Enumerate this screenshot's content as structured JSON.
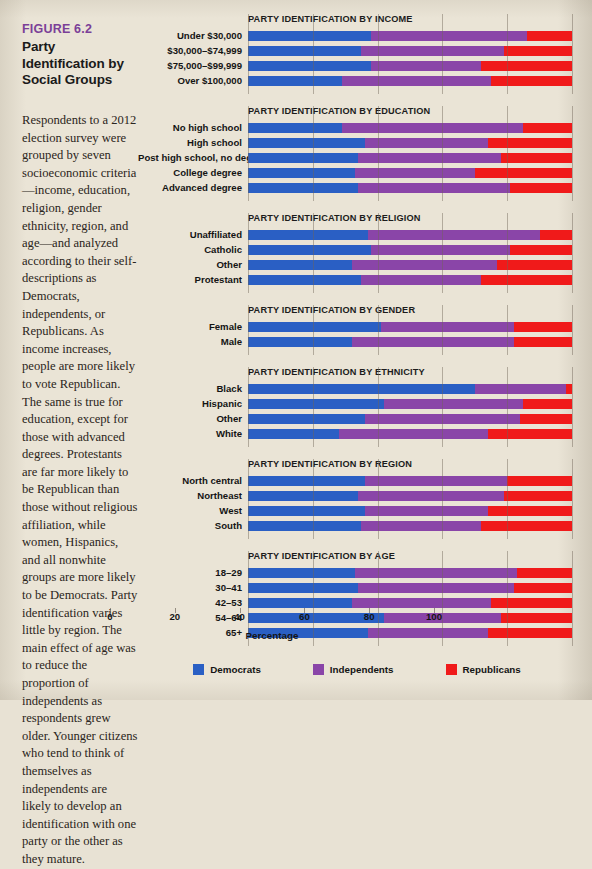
{
  "figure": {
    "label": "FIGURE 6.2",
    "heading": "Party Identification by Social Groups",
    "caption": "Respondents to a 2012 election survey were grouped by seven socioeconomic criteria—income, education, religion, gender ethnicity, region, and age—and analyzed according to their self-descriptions as Democrats, independents, or Republicans. As income increases, people are more likely to vote Republican. The same is true for education, except for those with advanced degrees. Protestants are far more likely to be Republican than those without religious affiliation, while women, Hispanics, and all nonwhite groups are more likely to be Democrats. Party identification varies little by region. The main effect of age was to reduce the proportion of independents as respondents grew older. Younger citizens who tend to think of themselves as independents are likely to develop an identification with one party or the other as they mature."
  },
  "colors": {
    "democrats": "#2a5fc4",
    "independents": "#8a45a8",
    "republicans": "#f01a1a",
    "figure_label": "#7b3f98",
    "background": "#eae4d6"
  },
  "legend": {
    "items": [
      {
        "label": "Democrats",
        "color": "#2a5fc4",
        "key": "dem"
      },
      {
        "label": "Independents",
        "color": "#8a45a8",
        "key": "ind"
      },
      {
        "label": "Republicans",
        "color": "#f01a1a",
        "key": "rep"
      }
    ]
  },
  "axis": {
    "title": "Percentage",
    "ticks": [
      0,
      20,
      40,
      60,
      80,
      100
    ],
    "min": 0,
    "max": 100
  },
  "chart_data": {
    "type": "bar",
    "subtype": "stacked-horizontal",
    "title": "Party Identification by Social Groups",
    "xlabel": "Percentage",
    "ylabel": "",
    "xlim": [
      0,
      100
    ],
    "grid": true,
    "legend_position": "bottom",
    "series": [
      {
        "name": "Democrats",
        "color": "#2a5fc4"
      },
      {
        "name": "Independents",
        "color": "#8a45a8"
      },
      {
        "name": "Republicans",
        "color": "#f01a1a"
      }
    ],
    "panels": [
      {
        "title": "PARTY IDENTIFICATION BY INCOME",
        "categories": [
          "Under $30,000",
          "$30,000–$74,999",
          "$75,000–$99,999",
          "Over $100,000"
        ],
        "values": [
          {
            "democrats": 38,
            "independents": 48,
            "republicans": 14
          },
          {
            "democrats": 35,
            "independents": 44,
            "republicans": 21
          },
          {
            "democrats": 38,
            "independents": 34,
            "republicans": 28
          },
          {
            "democrats": 29,
            "independents": 46,
            "republicans": 25
          }
        ]
      },
      {
        "title": "PARTY IDENTIFICATION BY EDUCATION",
        "categories": [
          "No high school",
          "High school",
          "Post high school, no degree",
          "College degree",
          "Advanced degree"
        ],
        "values": [
          {
            "democrats": 29,
            "independents": 56,
            "republicans": 15
          },
          {
            "democrats": 36,
            "independents": 38,
            "republicans": 26
          },
          {
            "democrats": 34,
            "independents": 44,
            "republicans": 22
          },
          {
            "democrats": 33,
            "independents": 37,
            "republicans": 30
          },
          {
            "democrats": 34,
            "independents": 47,
            "republicans": 19
          }
        ]
      },
      {
        "title": "PARTY IDENTIFICATION BY RELIGION",
        "categories": [
          "Unaffiliated",
          "Catholic",
          "Other",
          "Protestant"
        ],
        "values": [
          {
            "democrats": 37,
            "independents": 53,
            "republicans": 10
          },
          {
            "democrats": 38,
            "independents": 43,
            "republicans": 19
          },
          {
            "democrats": 32,
            "independents": 45,
            "republicans": 23
          },
          {
            "democrats": 35,
            "independents": 37,
            "republicans": 28
          }
        ]
      },
      {
        "title": "PARTY IDENTIFICATION BY GENDER",
        "categories": [
          "Female",
          "Male"
        ],
        "values": [
          {
            "democrats": 41,
            "independents": 41,
            "republicans": 18
          },
          {
            "democrats": 32,
            "independents": 50,
            "republicans": 18
          }
        ]
      },
      {
        "title": "PARTY IDENTIFICATION BY ETHNICITY",
        "categories": [
          "Black",
          "Hispanic",
          "Other",
          "White"
        ],
        "values": [
          {
            "democrats": 70,
            "independents": 28,
            "republicans": 2
          },
          {
            "democrats": 42,
            "independents": 43,
            "republicans": 15
          },
          {
            "democrats": 36,
            "independents": 48,
            "republicans": 16
          },
          {
            "democrats": 28,
            "independents": 46,
            "republicans": 26
          }
        ]
      },
      {
        "title": "PARTY IDENTIFICATION BY REGION",
        "categories": [
          "North central",
          "Northeast",
          "West",
          "South"
        ],
        "values": [
          {
            "democrats": 36,
            "independents": 44,
            "republicans": 20
          },
          {
            "democrats": 34,
            "independents": 45,
            "republicans": 21
          },
          {
            "democrats": 36,
            "independents": 38,
            "republicans": 26
          },
          {
            "democrats": 35,
            "independents": 37,
            "republicans": 28
          }
        ]
      },
      {
        "title": "PARTY IDENTIFICATION BY AGE",
        "categories": [
          "18–29",
          "30–41",
          "42–53",
          "54–64",
          "65+"
        ],
        "values": [
          {
            "democrats": 33,
            "independents": 50,
            "republicans": 17
          },
          {
            "democrats": 34,
            "independents": 48,
            "republicans": 18
          },
          {
            "democrats": 32,
            "independents": 43,
            "republicans": 25
          },
          {
            "democrats": 42,
            "independents": 36,
            "republicans": 22
          },
          {
            "democrats": 37,
            "independents": 37,
            "republicans": 26
          }
        ]
      }
    ]
  }
}
